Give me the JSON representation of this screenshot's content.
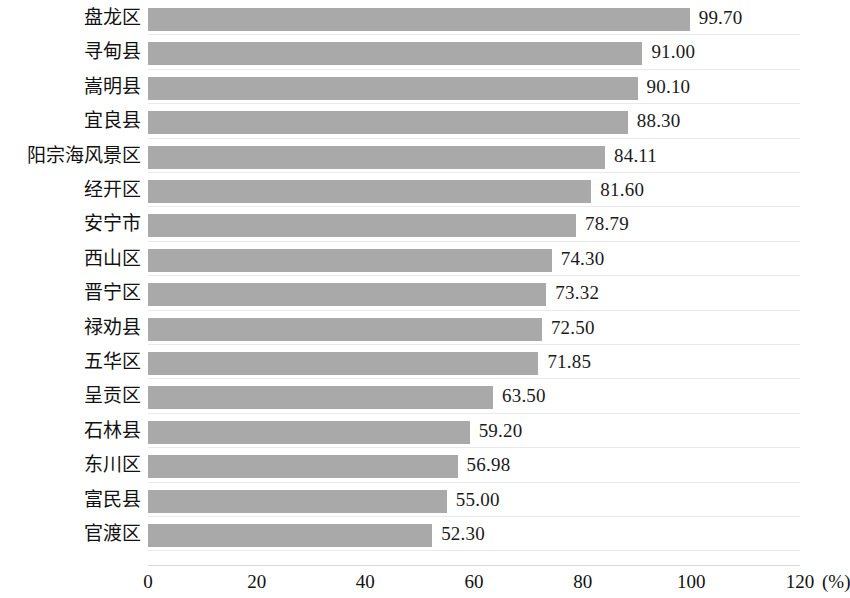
{
  "chart_data": {
    "type": "bar",
    "orientation": "horizontal",
    "title": "",
    "xlabel": "(%)",
    "ylabel": "",
    "xlim": [
      0,
      120
    ],
    "xticks": [
      "0",
      "20",
      "40",
      "60",
      "80",
      "100",
      "120"
    ],
    "grid": true,
    "legend": false,
    "bar_color": "#a9a9a9",
    "categories": [
      "盘龙区",
      "寻甸县",
      "嵩明县",
      "宜良县",
      "阳宗海风景区",
      "经开区",
      "安宁市",
      "西山区",
      "晋宁区",
      "禄劝县",
      "五华区",
      "呈贡区",
      "石林县",
      "东川区",
      "富民县",
      "官渡区"
    ],
    "values": [
      99.7,
      91.0,
      90.1,
      88.3,
      84.11,
      81.6,
      78.79,
      74.3,
      73.32,
      72.5,
      71.85,
      63.5,
      59.2,
      56.98,
      55.0,
      52.3
    ],
    "value_labels": [
      "99.70",
      "91.00",
      "90.10",
      "88.30",
      "84.11",
      "81.60",
      "78.79",
      "74.30",
      "73.32",
      "72.50",
      "71.85",
      "63.50",
      "59.20",
      "56.98",
      "55.00",
      "52.30"
    ]
  }
}
